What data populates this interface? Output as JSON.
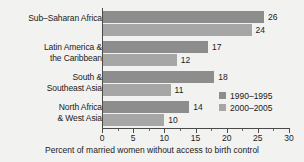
{
  "chart_data": {
    "type": "bar",
    "orientation": "horizontal",
    "title": "",
    "xlabel": "Percent of married women without access to birth control",
    "ylabel": "",
    "xlim": [
      0,
      30
    ],
    "grid": false,
    "legend_position": "inside-right",
    "categories": [
      "Sub–Saharan Africa",
      "Latin America &\nthe Caribbean",
      "South &\nSoutheast Asia",
      "North Africa\n& West Asia"
    ],
    "series": [
      {
        "name": "1990–1995",
        "color": "#8d8d8d",
        "values": [
          26,
          17,
          18,
          14
        ]
      },
      {
        "name": "2000–2005",
        "color": "#a6a6a6",
        "values": [
          24,
          12,
          11,
          10
        ]
      }
    ],
    "xticks": [
      0,
      5,
      10,
      15,
      20,
      25,
      30
    ],
    "xtick_labels": [
      "0",
      "5",
      "10",
      "15",
      "20",
      "25",
      "30"
    ],
    "xminor_ticks": [
      2.5,
      7.5,
      12.5,
      17.5,
      22.5,
      27.5
    ],
    "value_labels": [
      "26",
      "24",
      "17",
      "12",
      "18",
      "11",
      "14",
      "10"
    ]
  },
  "colors": {
    "background": "#f2f2f0",
    "axis": "#4a4a4a",
    "text": "#1b1b1b",
    "series_1990_1995": "#8d8d8d",
    "series_2000_2005": "#a6a6a6"
  }
}
